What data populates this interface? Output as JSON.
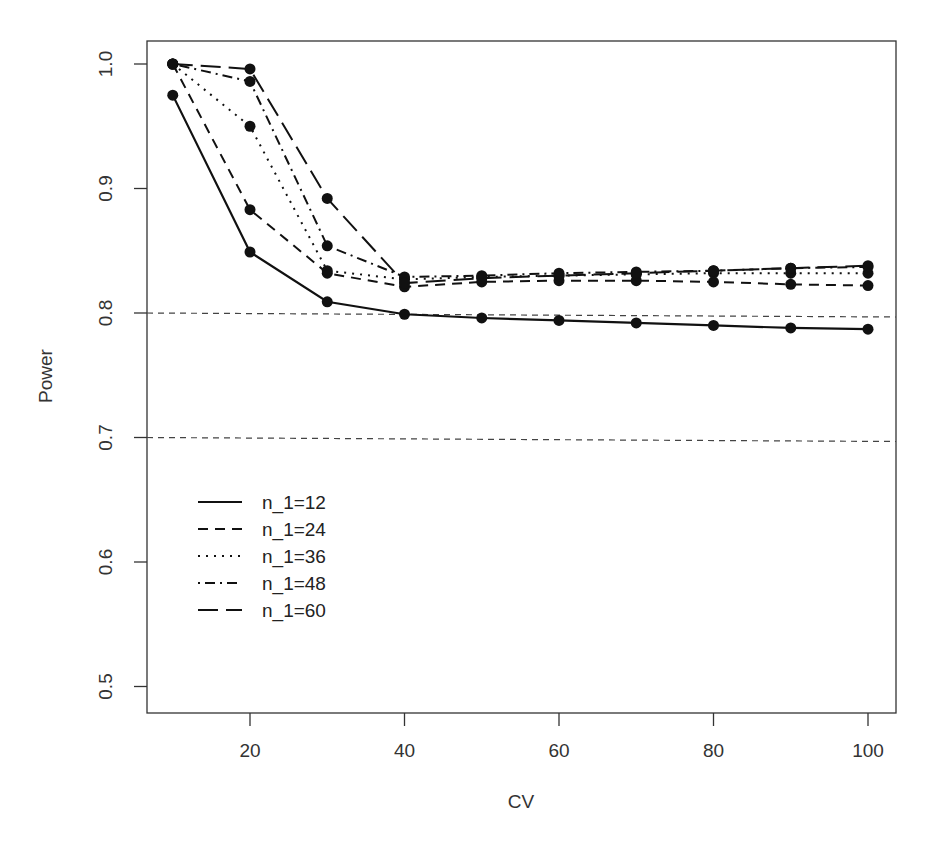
{
  "chart_data": {
    "type": "line",
    "title": "",
    "xlabel": "CV",
    "ylabel": "Power",
    "xlim": [
      7,
      104
    ],
    "ylim": [
      0.48,
      1.02
    ],
    "x_ticks": [
      20,
      40,
      60,
      80,
      100
    ],
    "y_ticks": [
      0.5,
      0.6,
      0.7,
      0.8,
      0.9,
      1.0
    ],
    "y_tick_labels": [
      "0.5",
      "0.6",
      "0.7",
      "0.8",
      "0.9",
      "1.0"
    ],
    "grid": false,
    "legend_position": "lower-left inside",
    "reference_lines": [
      {
        "y": 0.8,
        "style": "dashed"
      },
      {
        "y": 0.7,
        "style": "dashed"
      }
    ],
    "x": [
      10,
      20,
      30,
      40,
      50,
      60,
      70,
      80,
      90,
      100
    ],
    "series": [
      {
        "name": "n_1=12",
        "dash": "solid",
        "values": [
          0.975,
          0.849,
          0.809,
          0.799,
          0.796,
          0.794,
          0.792,
          0.79,
          0.788,
          0.787
        ]
      },
      {
        "name": "n_1=24",
        "dash": "dashed",
        "values": [
          1.0,
          0.883,
          0.832,
          0.821,
          0.825,
          0.826,
          0.826,
          0.825,
          0.823,
          0.822
        ]
      },
      {
        "name": "n_1=36",
        "dash": "dotted",
        "values": [
          1.0,
          0.95,
          0.834,
          0.827,
          0.829,
          0.83,
          0.831,
          0.832,
          0.832,
          0.832
        ]
      },
      {
        "name": "n_1=48",
        "dash": "dotdash",
        "values": [
          1.0,
          0.986,
          0.854,
          0.829,
          0.83,
          0.832,
          0.833,
          0.834,
          0.836,
          0.837
        ]
      },
      {
        "name": "n_1=60",
        "dash": "longdash",
        "values": [
          1.0,
          0.996,
          0.892,
          0.824,
          0.828,
          0.83,
          0.832,
          0.834,
          0.836,
          0.838
        ]
      }
    ]
  },
  "colors": {
    "line": "#111111",
    "axis": "#333333",
    "background": "#ffffff"
  }
}
